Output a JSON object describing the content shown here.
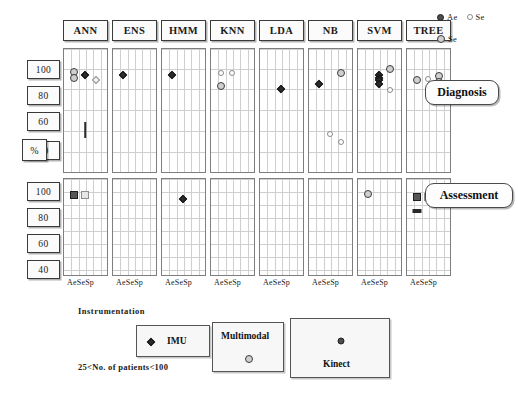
{
  "figure": {
    "axis_unit_label": "%",
    "x_tick_label": "AeSeSp",
    "caption": ""
  },
  "legend_top": {
    "entries": [
      {
        "label": "Ae",
        "marker": "filled-circle"
      },
      {
        "label": "Se",
        "marker": "open-circle"
      },
      {
        "label": "Se",
        "marker": "grey-circle"
      }
    ]
  },
  "row_labels": [
    {
      "label": "Diagnosis"
    },
    {
      "label": "Assessment"
    }
  ],
  "y_ticks": [
    "100",
    "80",
    "60",
    "40"
  ],
  "panels": [
    "ANN",
    "ENS",
    "HMM",
    "KNN",
    "LDA",
    "NB",
    "SVM",
    "TREE"
  ],
  "instrumentation": {
    "title": "Instrumentation",
    "note": "25<No. of patients<100",
    "items": [
      {
        "label": "IMU",
        "marker": "filled-diamond"
      },
      {
        "label": "Multimodal",
        "marker": "grey-circle"
      },
      {
        "label": "Kinect",
        "marker": "filled-circle"
      }
    ]
  },
  "chart_data": {
    "type": "scatter",
    "title": "",
    "xlabel": "",
    "ylabel": "%",
    "ylim": [
      30,
      105
    ],
    "yticks": [
      100,
      80,
      60,
      40
    ],
    "grid": true,
    "legend_position": "top-right",
    "x_categories": [
      "Ac",
      "Se",
      "Sp"
    ],
    "column_facets": [
      "ANN",
      "ENS",
      "HMM",
      "KNN",
      "LDA",
      "NB",
      "SVM",
      "TREE"
    ],
    "row_facets": [
      "Diagnosis",
      "Assessment"
    ],
    "marker_meaning": {
      "filled-diamond": "IMU",
      "open-diamond": "IMU (open)",
      "grey-circle": "Multimodal",
      "open-circle": "Multimodal (open)",
      "filled-circle": "Kinect",
      "filled-square": "Kinect (assessment)",
      "open-square": "Kinect (assessment, open)"
    },
    "points": [
      {
        "row": "Diagnosis",
        "panel": "ANN",
        "metric": "Ac",
        "value": 97,
        "marker": "grey-circle"
      },
      {
        "row": "Diagnosis",
        "panel": "ANN",
        "metric": "Ac",
        "value": 93,
        "marker": "grey-circle"
      },
      {
        "row": "Diagnosis",
        "panel": "ANN",
        "metric": "Se",
        "value": 95,
        "marker": "filled-diamond"
      },
      {
        "row": "Diagnosis",
        "panel": "ANN",
        "metric": "Sp",
        "value": 91,
        "marker": "open-diamond"
      },
      {
        "row": "Diagnosis",
        "panel": "ANN",
        "metric": "Se",
        "value": 55,
        "marker": "vertical-line"
      },
      {
        "row": "Diagnosis",
        "panel": "ENS",
        "metric": "Ac",
        "value": 95,
        "marker": "filled-diamond"
      },
      {
        "row": "Diagnosis",
        "panel": "HMM",
        "metric": "Ac",
        "value": 95,
        "marker": "filled-diamond"
      },
      {
        "row": "Diagnosis",
        "panel": "KNN",
        "metric": "Ac",
        "value": 96,
        "marker": "open-circle"
      },
      {
        "row": "Diagnosis",
        "panel": "KNN",
        "metric": "Se",
        "value": 96,
        "marker": "open-circle"
      },
      {
        "row": "Diagnosis",
        "panel": "KNN",
        "metric": "Ac",
        "value": 87,
        "marker": "grey-circle"
      },
      {
        "row": "Diagnosis",
        "panel": "LDA",
        "metric": "Se",
        "value": 85,
        "marker": "filled-diamond"
      },
      {
        "row": "Diagnosis",
        "panel": "NB",
        "metric": "Sp",
        "value": 96,
        "marker": "grey-circle"
      },
      {
        "row": "Diagnosis",
        "panel": "NB",
        "metric": "Ac",
        "value": 88,
        "marker": "filled-diamond"
      },
      {
        "row": "Diagnosis",
        "panel": "NB",
        "metric": "Se",
        "value": 52,
        "marker": "open-circle"
      },
      {
        "row": "Diagnosis",
        "panel": "NB",
        "metric": "Sp",
        "value": 46,
        "marker": "open-circle"
      },
      {
        "row": "Diagnosis",
        "panel": "SVM",
        "metric": "Sp",
        "value": 99,
        "marker": "grey-circle"
      },
      {
        "row": "Diagnosis",
        "panel": "SVM",
        "metric": "Se",
        "value": 95,
        "marker": "filled-diamond"
      },
      {
        "row": "Diagnosis",
        "panel": "SVM",
        "metric": "Se",
        "value": 93,
        "marker": "filled-diamond"
      },
      {
        "row": "Diagnosis",
        "panel": "SVM",
        "metric": "Se",
        "value": 91,
        "marker": "filled-diamond"
      },
      {
        "row": "Diagnosis",
        "panel": "SVM",
        "metric": "Se",
        "value": 88,
        "marker": "filled-diamond"
      },
      {
        "row": "Diagnosis",
        "panel": "SVM",
        "metric": "Sp",
        "value": 84,
        "marker": "open-circle"
      },
      {
        "row": "Diagnosis",
        "panel": "TREE",
        "metric": "Ac",
        "value": 91,
        "marker": "grey-circle"
      },
      {
        "row": "Diagnosis",
        "panel": "TREE",
        "metric": "Se",
        "value": 92,
        "marker": "open-circle"
      },
      {
        "row": "Diagnosis",
        "panel": "TREE",
        "metric": "Sp",
        "value": 94,
        "marker": "grey-circle"
      },
      {
        "row": "Diagnosis",
        "panel": "TREE",
        "metric": "Sp",
        "value": 90,
        "marker": "grey-circle"
      },
      {
        "row": "Diagnosis",
        "panel": "TREE",
        "metric": "Sp",
        "value": 82,
        "marker": "grey-circle"
      },
      {
        "row": "Assessment",
        "panel": "ANN",
        "metric": "Ac",
        "value": 96,
        "marker": "filled-square"
      },
      {
        "row": "Assessment",
        "panel": "ANN",
        "metric": "Se",
        "value": 96,
        "marker": "open-square"
      },
      {
        "row": "Assessment",
        "panel": "HMM",
        "metric": "Se",
        "value": 93,
        "marker": "filled-diamond"
      },
      {
        "row": "Assessment",
        "panel": "SVM",
        "metric": "Ac",
        "value": 97,
        "marker": "grey-circle"
      },
      {
        "row": "Assessment",
        "panel": "TREE",
        "metric": "Ac",
        "value": 95,
        "marker": "filled-square"
      },
      {
        "row": "Assessment",
        "panel": "TREE",
        "metric": "Se",
        "value": 95,
        "marker": "open-square"
      },
      {
        "row": "Assessment",
        "panel": "TREE",
        "metric": "Ac",
        "value": 84,
        "marker": "bar"
      }
    ]
  }
}
